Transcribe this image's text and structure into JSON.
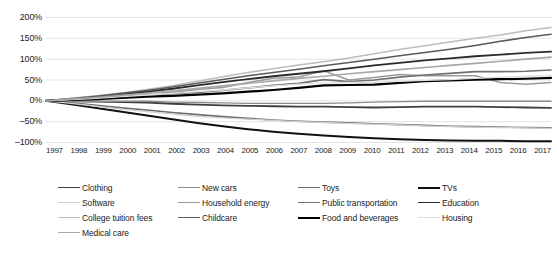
{
  "chart_data": {
    "type": "line",
    "title": "",
    "xlabel": "",
    "ylabel": "",
    "grid": true,
    "legend_position": "bottom",
    "xlim": [
      1997,
      2017
    ],
    "ylim": [
      -100,
      200
    ],
    "ytick_labels": [
      "200%",
      "150%",
      "100%",
      "50%",
      "0%",
      "–50%",
      "–100%"
    ],
    "ytick_values": [
      200,
      150,
      100,
      50,
      0,
      -50,
      -100
    ],
    "x": [
      1997,
      1998,
      1999,
      2000,
      2001,
      2002,
      2003,
      2004,
      2005,
      2006,
      2007,
      2008,
      2009,
      2010,
      2011,
      2012,
      2013,
      2014,
      2015,
      2016,
      2017
    ],
    "xtick_labels": [
      "1997",
      "1998",
      "1999",
      "2000",
      "2001",
      "2002",
      "2003",
      "2004",
      "2005",
      "2006",
      "2007",
      "2008",
      "2009",
      "2010",
      "2011",
      "2012",
      "2013",
      "2014",
      "2015",
      "2016",
      "2017"
    ],
    "series": [
      {
        "name": "Clothing",
        "color": "#3f3f3f",
        "width": 1.8,
        "values": [
          0,
          -1,
          -2,
          -3,
          -4,
          -7,
          -9,
          -11,
          -12,
          -13,
          -14,
          -14,
          -15,
          -16,
          -15,
          -14,
          -14,
          -14,
          -15,
          -16,
          -17
        ]
      },
      {
        "name": "New cars",
        "color": "#8c8c8c",
        "width": 1.4,
        "values": [
          0,
          -1,
          -1,
          -1,
          -1,
          -3,
          -4,
          -5,
          -6,
          -6,
          -6,
          -6,
          -5,
          -3,
          -2,
          -1,
          -1,
          -1,
          -1,
          -1,
          -1
        ]
      },
      {
        "name": "Toys",
        "color": "#6b6b6b",
        "width": 1.6,
        "values": [
          0,
          -5,
          -11,
          -17,
          -22,
          -28,
          -33,
          -38,
          -42,
          -46,
          -49,
          -51,
          -53,
          -55,
          -57,
          -59,
          -61,
          -62,
          -63,
          -64,
          -65
        ]
      },
      {
        "name": "TVs",
        "color": "#111111",
        "width": 2.0,
        "values": [
          0,
          -8,
          -17,
          -26,
          -35,
          -44,
          -53,
          -61,
          -68,
          -74,
          -79,
          -83,
          -87,
          -90,
          -92,
          -94,
          -95,
          -96,
          -96,
          -97,
          -97
        ]
      },
      {
        "name": "Software",
        "color": "#d0d0d0",
        "width": 1.3,
        "values": [
          0,
          -6,
          -13,
          -20,
          -26,
          -32,
          -37,
          -41,
          -44,
          -47,
          -50,
          -52,
          -54,
          -56,
          -58,
          -60,
          -62,
          -63,
          -64,
          -65,
          -66
        ]
      },
      {
        "name": "Household energy",
        "color": "#9a9a9a",
        "width": 1.5,
        "values": [
          0,
          2,
          6,
          16,
          22,
          20,
          27,
          32,
          44,
          54,
          57,
          72,
          50,
          56,
          63,
          60,
          60,
          60,
          44,
          40,
          44
        ]
      },
      {
        "name": "Public transportation",
        "color": "#707070",
        "width": 1.7,
        "values": [
          0,
          3,
          6,
          10,
          14,
          17,
          20,
          25,
          31,
          37,
          42,
          51,
          46,
          50,
          57,
          62,
          66,
          70,
          70,
          71,
          74
        ]
      },
      {
        "name": "Education",
        "color": "#2b2b2b",
        "width": 1.9,
        "values": [
          0,
          5,
          10,
          16,
          22,
          29,
          37,
          45,
          52,
          59,
          65,
          71,
          78,
          85,
          91,
          97,
          102,
          107,
          111,
          115,
          118
        ]
      },
      {
        "name": "College tuition fees",
        "color": "#bdbdbd",
        "width": 1.6,
        "values": [
          0,
          6,
          12,
          19,
          27,
          36,
          47,
          58,
          68,
          77,
          86,
          94,
          103,
          113,
          123,
          132,
          141,
          150,
          158,
          168,
          176
        ]
      },
      {
        "name": "Childcare",
        "color": "#5a5a5a",
        "width": 1.6,
        "values": [
          0,
          5,
          11,
          18,
          25,
          33,
          42,
          51,
          60,
          68,
          76,
          84,
          92,
          100,
          108,
          116,
          124,
          133,
          143,
          152,
          160
        ]
      },
      {
        "name": "Food and beverages",
        "color": "#000000",
        "width": 2.2,
        "values": [
          0,
          2,
          4,
          7,
          10,
          12,
          15,
          18,
          22,
          26,
          31,
          37,
          38,
          39,
          43,
          47,
          49,
          51,
          52,
          53,
          55
        ]
      },
      {
        "name": "Housing",
        "color": "#e0e0e0",
        "width": 1.3,
        "values": [
          0,
          3,
          6,
          10,
          14,
          18,
          22,
          26,
          31,
          36,
          40,
          43,
          44,
          45,
          47,
          49,
          51,
          54,
          57,
          59,
          61
        ]
      },
      {
        "name": "Medical care",
        "color": "#a8a8a8",
        "width": 1.6,
        "values": [
          0,
          4,
          8,
          13,
          18,
          24,
          30,
          36,
          42,
          48,
          54,
          59,
          65,
          70,
          75,
          80,
          85,
          90,
          95,
          100,
          105
        ]
      }
    ]
  }
}
